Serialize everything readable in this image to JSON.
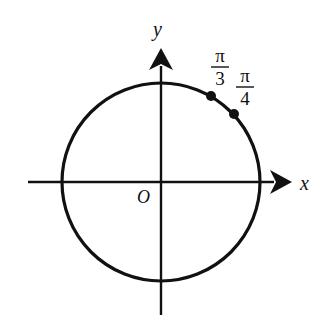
{
  "diagram": {
    "type": "unit-circle",
    "axes": {
      "x_label": "x",
      "y_label": "y",
      "origin_label": "O"
    },
    "points": [
      {
        "label_num": "π",
        "label_den": "3",
        "angle_deg": 60
      },
      {
        "label_num": "π",
        "label_den": "4",
        "angle_deg": 45
      }
    ],
    "colors": {
      "stroke": "#111111",
      "background": "#ffffff"
    }
  }
}
